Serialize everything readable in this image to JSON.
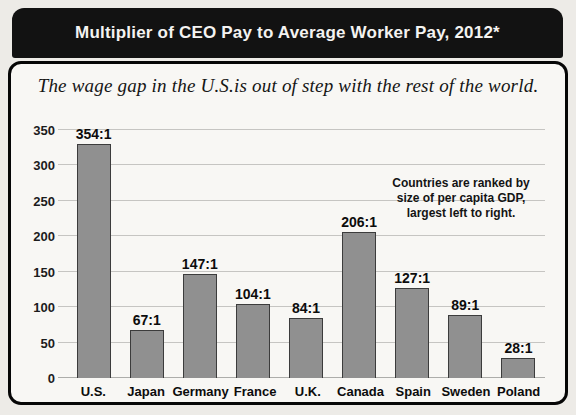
{
  "title_bar": {
    "title": "Multiplier of CEO Pay to Average Worker Pay, 2012*"
  },
  "panel": {
    "subtitle": "The wage gap in the U.S.is out of step with the rest of the world.",
    "annotation": {
      "line1": "Countries are ranked by",
      "line2": "size of per capita GDP,",
      "line3": "largest left to right."
    }
  },
  "chart_data": {
    "type": "bar",
    "title": "Multiplier of CEO Pay to Average Worker Pay, 2012*",
    "subtitle": "The wage gap in the U.S.is out of step with the rest of the world.",
    "categories": [
      "U.S.",
      "Japan",
      "Germany",
      "France",
      "U.K.",
      "Canada",
      "Spain",
      "Sweden",
      "Poland"
    ],
    "values": [
      354,
      67,
      147,
      104,
      84,
      206,
      127,
      89,
      28
    ],
    "value_labels": [
      "354:1",
      "67:1",
      "147:1",
      "104:1",
      "84:1",
      "206:1",
      "127:1",
      "89:1",
      "28:1"
    ],
    "xlabel": "",
    "ylabel": "",
    "ylim": [
      0,
      350
    ],
    "yticks": [
      0,
      50,
      100,
      150,
      200,
      250,
      300,
      350
    ],
    "grid": "horizontal",
    "legend": "none",
    "annotation": "Countries are ranked by size of per capita GDP, largest left to right.",
    "bar_color": "#909090",
    "bar_border_color": "#3c3c3c",
    "title_bar_color": "#121212",
    "title_text_color": "#f4f3f1"
  }
}
